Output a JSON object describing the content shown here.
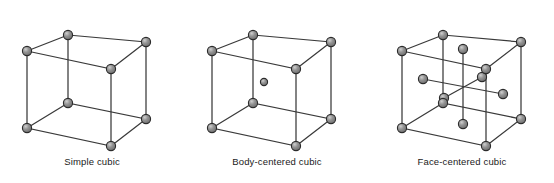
{
  "figure": {
    "background_color": "#ffffff",
    "edge_color": "#3a3a3a",
    "atom_fill": "#8c8c8c",
    "atom_stroke": "#2b2b2b",
    "atom_highlight": "#d8d8d8",
    "atom_radius": 4.6,
    "center_atom_radius": 3.6
  },
  "cells": [
    {
      "id": "simple-cubic",
      "label": "Simple cubic",
      "atom_count": 8,
      "corner_atoms": 8,
      "interior_atoms": 0,
      "face_atoms": 0,
      "interior_guides": false
    },
    {
      "id": "body-centered-cubic",
      "label": "Body-centered cubic",
      "atom_count": 9,
      "corner_atoms": 8,
      "interior_atoms": 1,
      "face_atoms": 0,
      "interior_guides": false
    },
    {
      "id": "face-centered-cubic",
      "label": "Face-centered cubic",
      "atom_count": 14,
      "corner_atoms": 8,
      "interior_atoms": 0,
      "face_atoms": 6,
      "interior_guides": true
    }
  ],
  "geometry": {
    "note": "oblique projection of a cube",
    "vertices": {
      "front_bottom_left": [
        12,
        118
      ],
      "front_bottom_right": [
        96,
        136
      ],
      "front_top_left": [
        12,
        41
      ],
      "front_top_right": [
        96,
        59
      ],
      "back_bottom_left": [
        53,
        93
      ],
      "back_bottom_right": [
        131,
        109
      ],
      "back_top_left": [
        53,
        25
      ],
      "back_top_right": [
        131,
        32
      ]
    },
    "face_centers": {
      "front": [
        54,
        88
      ],
      "back": [
        92,
        67
      ],
      "left": [
        33,
        69
      ],
      "right": [
        113,
        84
      ],
      "top": [
        73,
        39
      ],
      "bottom": [
        73,
        114
      ]
    }
  }
}
